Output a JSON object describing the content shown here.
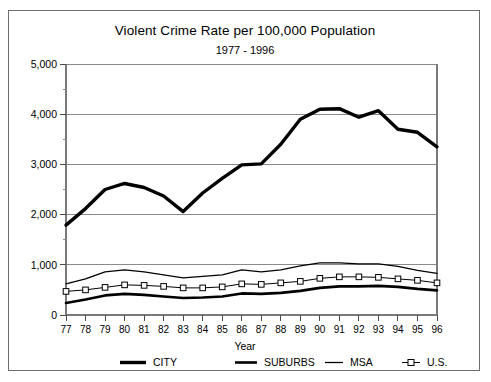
{
  "chart_data": {
    "type": "line",
    "title": "Violent Crime Rate per 100,000 Population",
    "subtitle": "1977 - 1996",
    "xlabel": "Year",
    "ylabel": "",
    "x": [
      1977,
      1978,
      1979,
      1980,
      1981,
      1982,
      1983,
      1984,
      1985,
      1986,
      1987,
      1988,
      1989,
      1990,
      1991,
      1992,
      1993,
      1994,
      1995,
      1996
    ],
    "categories": [
      "77",
      "78",
      "79",
      "80",
      "81",
      "82",
      "83",
      "84",
      "85",
      "86",
      "87",
      "88",
      "89",
      "90",
      "91",
      "92",
      "93",
      "94",
      "95",
      "96"
    ],
    "xlim": [
      1977,
      1996
    ],
    "ylim": [
      0,
      5000
    ],
    "yticks": [
      0,
      1000,
      2000,
      3000,
      4000,
      5000
    ],
    "ytick_labels": [
      "0",
      "1,000",
      "2,000",
      "3,000",
      "4,000",
      "5,000"
    ],
    "yticks_minor": [
      500,
      1500,
      2500,
      3500,
      4500
    ],
    "grid": "horizontal",
    "legend_position": "bottom",
    "series": [
      {
        "name": "CITY",
        "style": "thick-solid",
        "marker": "none",
        "values": [
          1790,
          2120,
          2500,
          2620,
          2540,
          2370,
          2060,
          2430,
          2720,
          2990,
          3010,
          3400,
          3900,
          4100,
          4110,
          3940,
          4070,
          3700,
          3640,
          3350
        ]
      },
      {
        "name": "SUBURBS",
        "style": "medium-solid",
        "marker": "none",
        "values": [
          240,
          310,
          390,
          420,
          400,
          370,
          340,
          350,
          370,
          430,
          420,
          440,
          480,
          540,
          570,
          570,
          580,
          560,
          520,
          490
        ]
      },
      {
        "name": "MSA",
        "style": "thin-solid",
        "marker": "none",
        "values": [
          620,
          720,
          860,
          900,
          860,
          800,
          740,
          770,
          800,
          900,
          860,
          900,
          980,
          1040,
          1040,
          1020,
          1020,
          970,
          890,
          830
        ]
      },
      {
        "name": "U.S.",
        "style": "thin-solid",
        "marker": "open-square",
        "values": [
          470,
          500,
          550,
          600,
          590,
          570,
          540,
          540,
          560,
          620,
          610,
          640,
          670,
          730,
          760,
          760,
          750,
          720,
          690,
          640
        ]
      }
    ],
    "colors": {
      "series_line": "#000000",
      "gridline": "#8a8a8a",
      "axis": "#7a7a7a",
      "background": "#ffffff",
      "marker_fill": "#ffffff"
    }
  },
  "legend": {
    "items": [
      {
        "label": "CITY"
      },
      {
        "label": "SUBURBS"
      },
      {
        "label": "MSA"
      },
      {
        "label": "U.S."
      }
    ]
  }
}
